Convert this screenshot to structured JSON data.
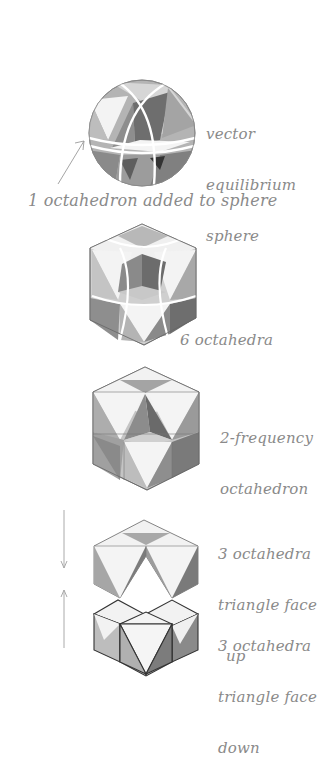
{
  "figures": [
    {
      "id": "vector-equilibrium-sphere",
      "label_lines": [
        "vector",
        "equilibrium",
        "sphere"
      ],
      "caption": "1 octahedron added to sphere"
    },
    {
      "id": "six-octahedra",
      "label_lines": [
        "6 octahedra"
      ]
    },
    {
      "id": "two-frequency-octahedron",
      "label_lines": [
        "2-frequency",
        "octahedron"
      ]
    },
    {
      "id": "three-octahedra-face-up",
      "label_lines": [
        "3 octahedra",
        "triangle face",
        "up"
      ]
    },
    {
      "id": "three-octahedra-face-down",
      "label_lines": [
        "3 octahedra",
        "triangle face",
        "down"
      ]
    }
  ],
  "colors": {
    "background": "#ffffff",
    "ink": "#8a8a8a",
    "face_light": "#f2f2f2",
    "face_mid": "#c8c8c8",
    "face_shade": "#a8a8a8",
    "face_dark": "#7a7a7a",
    "outline": "#555555"
  }
}
